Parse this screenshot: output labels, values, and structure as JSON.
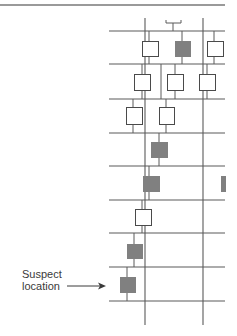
{
  "diagram": {
    "colors": {
      "line": "#5a5a5a",
      "top_rule": "#9a9a9a",
      "box_fill_normal": "#ffffff",
      "box_fill_highlight": "#808080",
      "box_stroke": "#4a4a4a",
      "text": "#3a3a3a"
    },
    "top_rule": {
      "x1": 0,
      "x2": 225,
      "y": 5
    },
    "rails": [
      {
        "y": 31,
        "x1": 109,
        "x2": 225
      },
      {
        "y": 64,
        "x1": 109,
        "x2": 225
      },
      {
        "y": 99,
        "x1": 109,
        "x2": 225
      },
      {
        "y": 133,
        "x1": 109,
        "x2": 225
      },
      {
        "y": 166,
        "x1": 109,
        "x2": 225
      },
      {
        "y": 200,
        "x1": 109,
        "x2": 225
      },
      {
        "y": 233,
        "x1": 109,
        "x2": 225
      },
      {
        "y": 267,
        "x1": 109,
        "x2": 225
      },
      {
        "y": 301,
        "x1": 109,
        "x2": 225
      }
    ],
    "trunks": [
      {
        "x": 145,
        "y1": 18,
        "y2": 325
      },
      {
        "x": 203,
        "y1": 18,
        "y2": 325
      }
    ],
    "bracket": {
      "x1": 166,
      "x2": 181,
      "y": 23,
      "tick_top": 20,
      "stem_x": 173,
      "stem_y2": 31
    },
    "boxes": [
      {
        "id": "r1-a",
        "x": 142,
        "y": 41,
        "w": 16,
        "h": 15,
        "highlight": false
      },
      {
        "id": "r1-b",
        "x": 175,
        "y": 41,
        "w": 15,
        "h": 15,
        "highlight": true
      },
      {
        "id": "r1-c",
        "x": 207,
        "y": 41,
        "w": 16,
        "h": 15,
        "highlight": false
      },
      {
        "id": "r2-a",
        "x": 134,
        "y": 74,
        "w": 16,
        "h": 16,
        "highlight": false
      },
      {
        "id": "r2-b",
        "x": 167,
        "y": 74,
        "w": 16,
        "h": 16,
        "highlight": false
      },
      {
        "id": "r2-c",
        "x": 199,
        "y": 74,
        "w": 16,
        "h": 16,
        "highlight": false
      },
      {
        "id": "r3-a",
        "x": 126,
        "y": 107,
        "w": 16,
        "h": 17,
        "highlight": false
      },
      {
        "id": "r3-b",
        "x": 159,
        "y": 107,
        "w": 15,
        "h": 17,
        "highlight": false
      },
      {
        "id": "r4-a",
        "x": 151,
        "y": 142,
        "w": 16,
        "h": 15,
        "highlight": true
      },
      {
        "id": "r5-a",
        "x": 143,
        "y": 176,
        "w": 16,
        "h": 15,
        "highlight": true
      },
      {
        "id": "r5-edge",
        "x": 221,
        "y": 176,
        "w": 4,
        "h": 15,
        "highlight": true
      },
      {
        "id": "r6-a",
        "x": 135,
        "y": 209,
        "w": 16,
        "h": 16,
        "highlight": false
      },
      {
        "id": "r7-a",
        "x": 127,
        "y": 244,
        "w": 15,
        "h": 14,
        "highlight": true
      },
      {
        "id": "r8-suspect",
        "x": 120,
        "y": 277,
        "w": 15,
        "h": 15,
        "highlight": true
      }
    ],
    "stubs": [
      {
        "x": 149,
        "y1": 31,
        "y2": 41
      },
      {
        "x": 149,
        "y1": 56,
        "y2": 64
      },
      {
        "x": 182,
        "y1": 31,
        "y2": 41
      },
      {
        "x": 182,
        "y1": 56,
        "y2": 64
      },
      {
        "x": 214,
        "y1": 31,
        "y2": 41
      },
      {
        "x": 214,
        "y1": 56,
        "y2": 64
      },
      {
        "x": 142,
        "y1": 64,
        "y2": 74
      },
      {
        "x": 142,
        "y1": 90,
        "y2": 99
      },
      {
        "x": 175,
        "y1": 64,
        "y2": 74
      },
      {
        "x": 175,
        "y1": 90,
        "y2": 99
      },
      {
        "x": 207,
        "y1": 64,
        "y2": 74
      },
      {
        "x": 207,
        "y1": 90,
        "y2": 99
      },
      {
        "x": 161,
        "y1": 64,
        "y2": 99
      },
      {
        "x": 133,
        "y1": 99,
        "y2": 107
      },
      {
        "x": 133,
        "y1": 124,
        "y2": 133
      },
      {
        "x": 166,
        "y1": 99,
        "y2": 107
      },
      {
        "x": 166,
        "y1": 124,
        "y2": 133
      },
      {
        "x": 159,
        "y1": 133,
        "y2": 142
      },
      {
        "x": 159,
        "y1": 157,
        "y2": 166
      },
      {
        "x": 149,
        "y1": 166,
        "y2": 176
      },
      {
        "x": 149,
        "y1": 191,
        "y2": 200
      },
      {
        "x": 142,
        "y1": 200,
        "y2": 209
      },
      {
        "x": 142,
        "y1": 225,
        "y2": 233
      },
      {
        "x": 134,
        "y1": 233,
        "y2": 244
      },
      {
        "x": 134,
        "y1": 258,
        "y2": 267
      },
      {
        "x": 127,
        "y1": 267,
        "y2": 277
      },
      {
        "x": 127,
        "y1": 292,
        "y2": 301
      }
    ],
    "annotation": {
      "line1": "Suspect",
      "line2": "location",
      "text_x": 22,
      "text_y": 268,
      "arrow": {
        "x1": 67,
        "x2": 106,
        "y": 286
      }
    }
  }
}
